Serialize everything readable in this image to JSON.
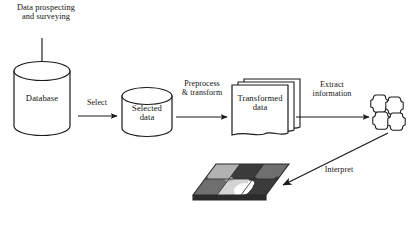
{
  "diagram": {
    "background_color": "#ffffff",
    "stroke_color": "#1a1a1a",
    "nodes": {
      "database": {
        "label": "Database",
        "shape": "cylinder"
      },
      "selected_data": {
        "label": "Selected\ndata",
        "shape": "cylinder"
      },
      "transformed_data": {
        "label": "Transformed\ndata",
        "shape": "document-stack"
      },
      "patterns": {
        "label": "",
        "shape": "puzzle-cluster"
      },
      "knowledge_board": {
        "label": "",
        "shape": "puzzle-board"
      }
    },
    "edges": {
      "prospecting": {
        "label": "Data prospecting\nand surveying"
      },
      "select": {
        "label": "Select"
      },
      "preprocess": {
        "label": "Preprocess\n& transform"
      },
      "extract": {
        "label": "Extract\ninformation"
      },
      "interpret": {
        "label": "Interpret"
      }
    },
    "palette": {
      "piece_dark": "#3b3b3b",
      "piece_mid": "#6f6f6f",
      "piece_light": "#b3b3b3",
      "piece_pale": "#d4d4d4",
      "piece_white": "#ffffff",
      "board_edge": "#2b2b2b"
    }
  }
}
